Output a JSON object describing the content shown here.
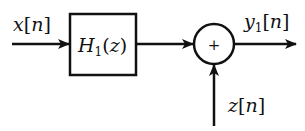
{
  "diagram": {
    "type": "signal-flow block diagram",
    "input": {
      "label_var": "x",
      "label_index": "n"
    },
    "block": {
      "label_func": "H",
      "label_sub": "1",
      "label_arg": "z"
    },
    "adder": {
      "symbol": "+"
    },
    "output": {
      "label_var": "y",
      "label_sub": "1",
      "label_index": "n"
    },
    "side_input": {
      "label_var": "z",
      "label_index": "n"
    },
    "colors": {
      "stroke": "#111111",
      "background": "#ffffff"
    }
  }
}
